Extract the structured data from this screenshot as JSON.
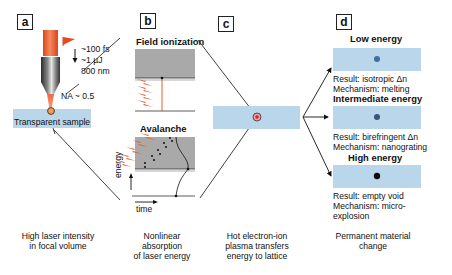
{
  "panels": {
    "a": {
      "label": "a",
      "pulse": {
        "duration": "~100 fs",
        "energy": "~1 µJ",
        "wavelength": "800 nm"
      },
      "na": "NA ~ 0.5",
      "sample": "Transparent sample",
      "caption_line1": "High laser intensity",
      "caption_line2": "in focal volume"
    },
    "b": {
      "label": "b",
      "field_ionization": "Field ionization",
      "avalanche": "Avalanche",
      "axis_energy": "energy",
      "axis_time": "time",
      "caption_line1": "Nonlinear",
      "caption_line2": "absorption",
      "caption_line3": "of laser energy"
    },
    "c": {
      "label": "c",
      "caption_line1": "Hot electron-ion",
      "caption_line2": "plasma transfers",
      "caption_line3": "energy to lattice"
    },
    "d": {
      "label": "d",
      "regimes": [
        {
          "title": "Low energy",
          "result": "Result: isotropic Δn",
          "mechanism": "Mechanism: melting",
          "dot_color": "#3f6ea3"
        },
        {
          "title": "Intermediate energy",
          "result": "Result: birefringent Δn",
          "mechanism": "Mechanism: nanograting",
          "dot_color": "#38557a"
        },
        {
          "title": "High energy",
          "result": "Result: empty void",
          "mechanism_line1": "Mechanism: micro-",
          "mechanism_line2": "explosion",
          "dot_color": "#0a0a0a"
        }
      ],
      "caption_line1": "Permanent material",
      "caption_line2": "change"
    }
  },
  "colors": {
    "sample_blue": "#b9d6ea",
    "laser_red": "#e8552c",
    "plasma_gray": "#a9a9a9"
  }
}
